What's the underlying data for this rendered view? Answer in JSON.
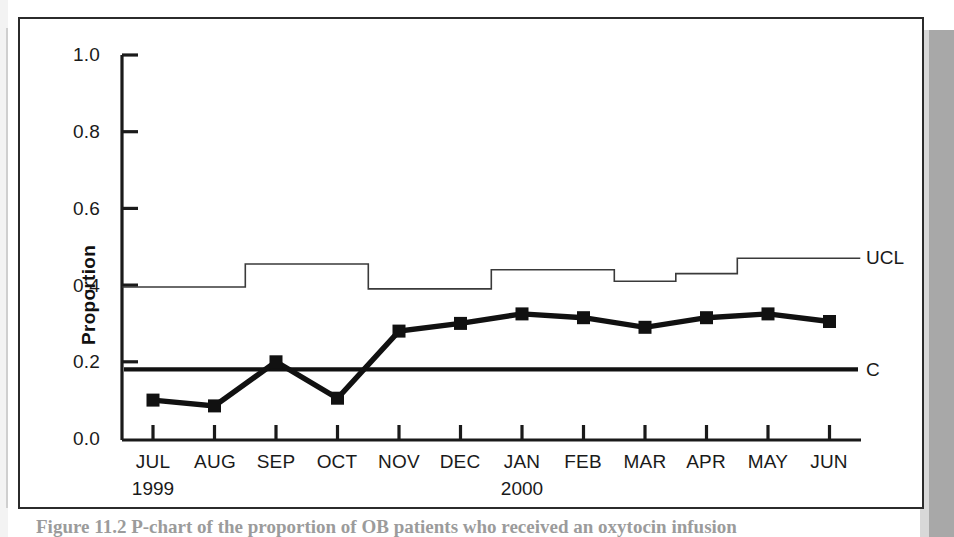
{
  "figure": {
    "y_axis_title": "Proportion",
    "ucl_label": "UCL",
    "center_label": "C",
    "year_start": "1999",
    "year_end": "2000",
    "caption_partial": "Figure 11.2  P-chart of the proportion of OB patients who received an oxytocin infusion"
  },
  "chart_data": {
    "type": "line",
    "title": "",
    "xlabel": "",
    "ylabel": "Proportion",
    "ylim": [
      0.0,
      1.0
    ],
    "yticks": [
      "0.0",
      "0.2",
      "0.4",
      "0.6",
      "0.8",
      "1.0"
    ],
    "ytick_values": [
      0.0,
      0.2,
      0.4,
      0.6,
      0.8,
      1.0
    ],
    "grid": false,
    "legend": "inline-right",
    "categories": [
      "JUL",
      "AUG",
      "SEP",
      "OCT",
      "NOV",
      "DEC",
      "JAN",
      "FEB",
      "MAR",
      "APR",
      "MAY",
      "JUN"
    ],
    "year_markers": [
      {
        "category": "JUL",
        "year": "1999"
      },
      {
        "category": "JAN",
        "year": "2000"
      }
    ],
    "series": [
      {
        "name": "Proportion",
        "style": "line-with-square-markers",
        "values": [
          0.1,
          0.085,
          0.2,
          0.105,
          0.28,
          0.3,
          0.325,
          0.315,
          0.29,
          0.315,
          0.325,
          0.305
        ]
      },
      {
        "name": "UCL",
        "style": "step",
        "values": [
          0.395,
          0.395,
          0.455,
          0.455,
          0.39,
          0.39,
          0.44,
          0.44,
          0.41,
          0.43,
          0.47,
          0.47
        ]
      },
      {
        "name": "C",
        "style": "constant",
        "values": [
          0.18,
          0.18,
          0.18,
          0.18,
          0.18,
          0.18,
          0.18,
          0.18,
          0.18,
          0.18,
          0.18,
          0.18
        ]
      }
    ]
  },
  "colors": {
    "line": "#111111",
    "ucl": "#3a3a3a",
    "center": "#111111",
    "frame": "#2b2b2b",
    "page": "#ffffff",
    "shadow": "#a8a8a8"
  }
}
